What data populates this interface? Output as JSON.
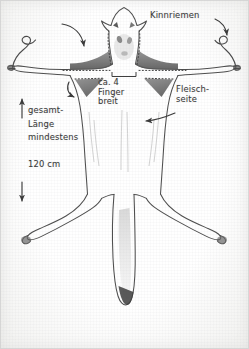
{
  "image": {
    "title": "Praparierte Tierhaut - Zuschnitt",
    "medium": "pencil sketch on paper",
    "width": 249,
    "height": 349,
    "background_color": "#fbfbfa",
    "ink_color": "#4a4a4a",
    "shading_color": "#6e6e6e"
  },
  "annotations": {
    "chin_strap": "Kinnriemen",
    "four_fingers": "ca. 4\nFinger\nbreit",
    "flesh_side": "Fleisch-\nseite",
    "total_length": "gesamt-\nLänge\nmindestens\n\n120 cm"
  },
  "markers": {
    "arrow_up": "arrow-up",
    "arrow_down": "arrow-down",
    "arrow_to_shoulder": "curved-arrow-down-left",
    "arrow_to_chin_strap": "curved-arrow-down-right",
    "arrow_to_armpit": "curved-arrow-down",
    "arrow_to_flesh_side": "curved-arrow-left",
    "cut_line": "dotted-cut-line",
    "center_bracket": "width-bracket"
  },
  "subject": {
    "head": "animal head with ears and eye holes",
    "front_legs": "front legs spread horizontally",
    "hind_legs": "hind legs splayed downward",
    "tail": "tail centered between hind legs",
    "cords": "two curled chin strap cords at front paws"
  }
}
